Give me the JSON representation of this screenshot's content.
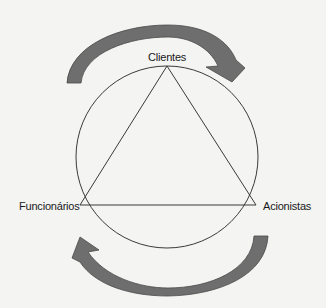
{
  "diagram": {
    "nodes": {
      "top": "Clientes",
      "left": "Funcionários",
      "right": "Acionistas"
    },
    "colors": {
      "background": "#f4f4f2",
      "line": "#3a3a3a",
      "arrow_fill": "#6e6e6e",
      "arrow_stroke": "#4a4a4a"
    },
    "arrows": [
      {
        "name": "top-arrow",
        "direction": "clockwise",
        "from": "left-upper",
        "to": "right-upper"
      },
      {
        "name": "bottom-arrow",
        "direction": "clockwise",
        "from": "right-lower",
        "to": "left-lower"
      }
    ]
  }
}
